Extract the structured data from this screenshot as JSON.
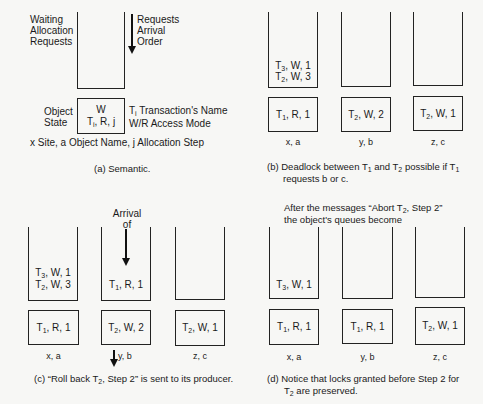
{
  "panel_a": {
    "waiting_label": [
      "Waiting",
      "Allocation",
      "Requests"
    ],
    "arrow_label": [
      "Requests",
      "Arrival",
      "Order"
    ],
    "object_state_label": [
      "Object",
      "State"
    ],
    "box_line1": "W",
    "box_line2_T": "T",
    "box_line2_sub": "i",
    "box_line2_rest": ", R, j",
    "legend_T": "T",
    "legend_T_sub": "i",
    "legend_line1_rest": " Transaction's Name",
    "legend_line2": "W/R Access Mode",
    "footnote": "x Site, a Object Name, j Allocation Step",
    "caption": "(a) Semantic."
  },
  "panel_b": {
    "queues": [
      {
        "site_label": "x, a",
        "waiting": [
          {
            "t": "3",
            "rest": ", W, 1"
          },
          {
            "t": "2",
            "rest": ", W, 3"
          }
        ],
        "state": {
          "t": "1",
          "rest": ", R, 1"
        }
      },
      {
        "site_label": "y, b",
        "waiting": [],
        "state": {
          "t": "2",
          "rest": ", W, 2"
        }
      },
      {
        "site_label": "z, c",
        "waiting": [],
        "state": {
          "t": "2",
          "rest": ", W, 1"
        }
      }
    ],
    "caption_part1": "(b) Deadlock between T",
    "caption_sub1": "1",
    "caption_part2": " and T",
    "caption_sub2": "2",
    "caption_part3": " possible if T",
    "caption_sub3": "1",
    "caption_line2": "requests b or c."
  },
  "panel_c": {
    "arrival_label": [
      "Arrival",
      "of"
    ],
    "queues": [
      {
        "site_label": "x, a",
        "waiting": [
          {
            "t": "3",
            "rest": ", W, 1"
          },
          {
            "t": "2",
            "rest": ", W, 3"
          }
        ],
        "state": {
          "t": "1",
          "rest": ", R, 1"
        }
      },
      {
        "site_label": "y, b",
        "waiting": [
          {
            "t": "1",
            "rest": ", R, 1"
          }
        ],
        "state": {
          "t": "2",
          "rest": ", W, 2"
        }
      },
      {
        "site_label": "z, c",
        "waiting": [],
        "state": {
          "t": "2",
          "rest": ", W, 1"
        }
      }
    ],
    "caption_part1": "(c) “Roll back T",
    "caption_sub": "2",
    "caption_part2": ", Step 2” is sent to its producer."
  },
  "panel_d": {
    "header_part1": "After the messages “Abort T",
    "header_sub": "2",
    "header_part2": ", Step 2”",
    "header_line2": "the object's queues become",
    "queues": [
      {
        "site_label": "x, a",
        "waiting": [
          {
            "t": "3",
            "rest": ", W, 1"
          }
        ],
        "state": {
          "t": "1",
          "rest": ", R, 1"
        }
      },
      {
        "site_label": "y, b",
        "waiting": [],
        "state": {
          "t": "1",
          "rest": ", R, 1"
        }
      },
      {
        "site_label": "z, c",
        "waiting": [],
        "state": {
          "t": "2",
          "rest": ", W, 1"
        }
      }
    ],
    "caption_line1": "(d) Notice that locks granted before Step 2 for",
    "caption_T": "T",
    "caption_sub": "2",
    "caption_line2_rest": " are preserved."
  }
}
